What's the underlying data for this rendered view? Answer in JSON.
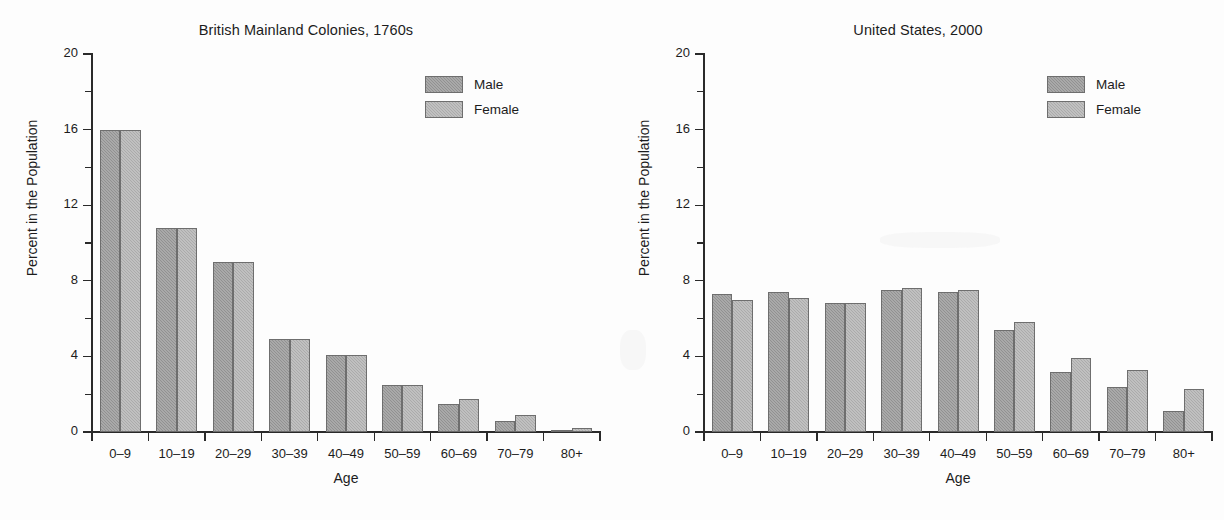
{
  "figure": {
    "background": "#fdfdfd",
    "male_color": "#919191",
    "female_color": "#ababab",
    "axis_color": "#2a2a2a"
  },
  "legend": {
    "male_label": "Male",
    "female_label": "Female"
  },
  "axes": {
    "ylabel": "Percent in the Population",
    "xlabel": "Age",
    "y_ticks": [
      "0",
      "4",
      "8",
      "12",
      "16",
      "20"
    ],
    "y_tick_values": [
      0,
      4,
      8,
      12,
      16,
      20
    ],
    "y_minor_values": [
      2,
      6,
      10,
      14,
      18
    ],
    "categories": [
      "0–9",
      "10–19",
      "20–29",
      "30–39",
      "40–49",
      "50–59",
      "60–69",
      "70–79",
      "80+"
    ]
  },
  "chart_data": [
    {
      "type": "bar",
      "title": "British Mainland Colonies, 1760s",
      "xlabel": "Age",
      "ylabel": "Percent in the Population",
      "ylim": [
        0,
        20
      ],
      "grid": false,
      "legend_position": "upper right",
      "categories": [
        "0–9",
        "10–19",
        "20–29",
        "30–39",
        "40–49",
        "50–59",
        "60–69",
        "70–79",
        "80+"
      ],
      "series": [
        {
          "name": "Male",
          "values": [
            16.0,
            10.8,
            9.0,
            4.9,
            4.1,
            2.5,
            1.5,
            0.6,
            0.05
          ]
        },
        {
          "name": "Female",
          "values": [
            16.0,
            10.8,
            9.0,
            4.9,
            4.1,
            2.5,
            1.75,
            0.9,
            0.2
          ]
        }
      ]
    },
    {
      "type": "bar",
      "title": "United States, 2000",
      "xlabel": "Age",
      "ylabel": "Percent in the Population",
      "ylim": [
        0,
        20
      ],
      "grid": false,
      "legend_position": "upper right",
      "categories": [
        "0–9",
        "10–19",
        "20–29",
        "30–39",
        "40–49",
        "50–59",
        "60–69",
        "70–79",
        "80+"
      ],
      "series": [
        {
          "name": "Male",
          "values": [
            7.3,
            7.4,
            6.8,
            7.5,
            7.4,
            5.4,
            3.2,
            2.4,
            1.1
          ]
        },
        {
          "name": "Female",
          "values": [
            7.0,
            7.1,
            6.8,
            7.6,
            7.5,
            5.8,
            3.9,
            3.3,
            2.3
          ]
        }
      ]
    }
  ]
}
